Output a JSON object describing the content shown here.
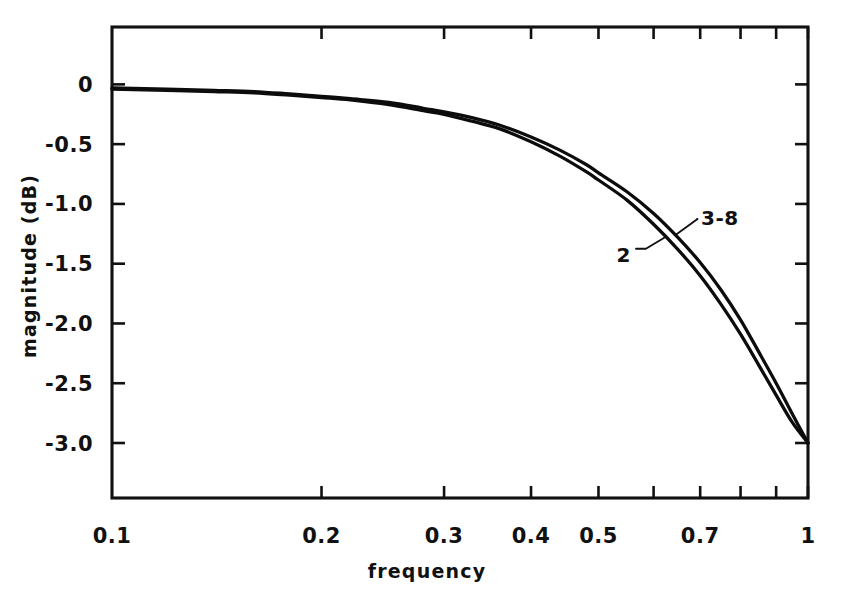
{
  "chart_data": {
    "type": "line",
    "title": "",
    "xlabel": "frequency",
    "ylabel": "magnitude  (dB)",
    "xscale": "log",
    "yscale": "linear",
    "xlim": [
      0.1,
      1.0
    ],
    "ylim": [
      -3.46,
      0.48
    ],
    "grid": false,
    "legend_position": "inline-annotations",
    "xticks_labeled": [
      "0.1",
      "0.2",
      "0.3",
      "0.4",
      "0.5",
      "0.7",
      "1"
    ],
    "xtick_values": [
      0.1,
      0.2,
      0.3,
      0.4,
      0.5,
      0.7,
      1.0
    ],
    "xticks_minor": [
      0.2,
      0.3,
      0.4,
      0.5,
      0.6,
      0.7,
      0.8,
      0.9,
      1.0
    ],
    "yticks_labeled": [
      "0",
      "-0.5",
      "-1.0",
      "-1.5",
      "-2.0",
      "-2.5",
      "-3.0"
    ],
    "ytick_values": [
      0,
      -0.5,
      -1.0,
      -1.5,
      -2.0,
      -2.5,
      -3.0
    ],
    "series": [
      {
        "name": "3-8",
        "label": "3-8",
        "color": "#0c0c0c",
        "x": [
          0.1,
          0.12,
          0.14,
          0.16,
          0.18,
          0.2,
          0.22,
          0.25,
          0.28,
          0.3,
          0.33,
          0.36,
          0.4,
          0.44,
          0.48,
          0.5,
          0.55,
          0.6,
          0.65,
          0.7,
          0.75,
          0.8,
          0.85,
          0.9,
          0.95,
          1.0
        ],
        "y": [
          -0.03,
          -0.04,
          -0.05,
          -0.06,
          -0.08,
          -0.1,
          -0.12,
          -0.15,
          -0.2,
          -0.23,
          -0.28,
          -0.34,
          -0.44,
          -0.55,
          -0.67,
          -0.74,
          -0.9,
          -1.08,
          -1.28,
          -1.49,
          -1.72,
          -1.97,
          -2.24,
          -2.5,
          -2.76,
          -3.0
        ]
      },
      {
        "name": "2",
        "label": "2",
        "color": "#0c0c0c",
        "x": [
          0.1,
          0.12,
          0.14,
          0.16,
          0.18,
          0.2,
          0.22,
          0.25,
          0.28,
          0.3,
          0.33,
          0.36,
          0.4,
          0.44,
          0.48,
          0.5,
          0.55,
          0.6,
          0.65,
          0.7,
          0.75,
          0.8,
          0.85,
          0.9,
          0.95,
          1.0
        ],
        "y": [
          -0.04,
          -0.05,
          -0.06,
          -0.07,
          -0.09,
          -0.11,
          -0.13,
          -0.17,
          -0.22,
          -0.25,
          -0.31,
          -0.37,
          -0.48,
          -0.6,
          -0.73,
          -0.8,
          -0.97,
          -1.17,
          -1.38,
          -1.6,
          -1.84,
          -2.09,
          -2.35,
          -2.6,
          -2.83,
          -3.0
        ]
      }
    ],
    "annotations": [
      {
        "text": "3-8",
        "points_to_series": "3-8",
        "x_px": 705,
        "y_px": 218
      },
      {
        "text": "2",
        "points_to_series": "2",
        "x_px": 620,
        "y_px": 255
      }
    ]
  }
}
